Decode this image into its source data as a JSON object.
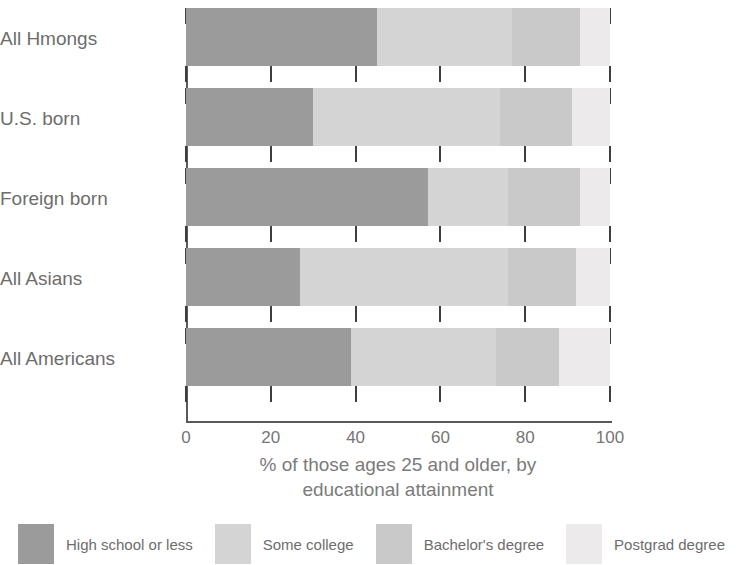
{
  "chart_data": {
    "type": "bar",
    "orientation": "horizontal",
    "stacked": true,
    "title": "",
    "xlabel": "% of those ages 25 and older, by educational attainment",
    "ylabel": "",
    "xlim": [
      0,
      100
    ],
    "xticks": [
      0,
      20,
      40,
      60,
      80,
      100
    ],
    "xticklabels": [
      "0",
      "20",
      "40",
      "60",
      "80",
      "100"
    ],
    "grid": false,
    "legend_position": "bottom",
    "categories": [
      "All Hmongs",
      "U.S. born",
      "Foreign born",
      "All Asians",
      "All Americans"
    ],
    "series": [
      {
        "name": "High school or less",
        "color": "#9b9b9b",
        "values": [
          45,
          30,
          57,
          27,
          39
        ]
      },
      {
        "name": "Some college",
        "color": "#d4d4d4",
        "values": [
          32,
          44,
          19,
          49,
          34
        ]
      },
      {
        "name": "Bachelor's degree",
        "color": "#c9c9c9",
        "values": [
          16,
          17,
          17,
          16,
          15
        ]
      },
      {
        "name": "Postgrad degree",
        "color": "#eceaea",
        "values": [
          7,
          9,
          7,
          8,
          12
        ]
      }
    ]
  },
  "axis": {
    "tick_labels": [
      "0",
      "20",
      "40",
      "60",
      "80",
      "100"
    ],
    "title_line1": "% of those ages 25 and older, by",
    "title_line2": "educational attainment"
  },
  "categories": [
    {
      "label": "All Hmongs"
    },
    {
      "label": "U.S. born"
    },
    {
      "label": "Foreign born"
    },
    {
      "label": "All Asians"
    },
    {
      "label": "All Americans"
    }
  ],
  "legend": {
    "items": [
      {
        "label": "High school or less",
        "color": "#9b9b9b"
      },
      {
        "label": "Some college",
        "color": "#d4d4d4"
      },
      {
        "label": "Bachelor's degree",
        "color": "#c9c9c9"
      },
      {
        "label": "Postgrad degree",
        "color": "#eceaea"
      }
    ]
  },
  "colors": {
    "axis": "#595959",
    "text": "#6d6d6d",
    "background": "#ffffff"
  }
}
